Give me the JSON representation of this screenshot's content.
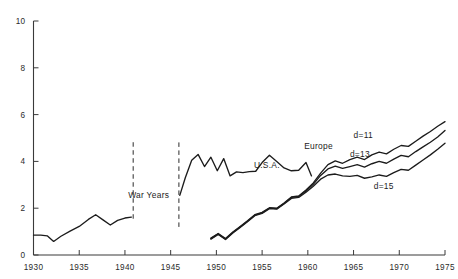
{
  "chart_data": {
    "type": "line",
    "title": "",
    "xlabel": "",
    "ylabel": "",
    "xlim": [
      1930,
      1975
    ],
    "ylim": [
      0,
      10
    ],
    "grid": false,
    "legend_position": "inline-labels",
    "x_ticks": [
      1930,
      1935,
      1940,
      1945,
      1950,
      1955,
      1960,
      1965,
      1970,
      1975
    ],
    "x_tick_labels": [
      "1930",
      "1935",
      "1940",
      "1945",
      "1950",
      "1955",
      "1960",
      "1965",
      "1970",
      "1975"
    ],
    "y_ticks": [
      0,
      2,
      4,
      6,
      8,
      10
    ],
    "y_tick_labels": [
      "0",
      "2",
      "4",
      "6",
      "8",
      "10"
    ],
    "annotations": [
      {
        "text": "War Years",
        "x": 1942.6,
        "y": 2.45,
        "name": "war-years-label"
      }
    ],
    "vertical_dividers": [
      {
        "x": 1940.9,
        "y0": 1.55,
        "y1": 4.9,
        "name": "war-start-divider"
      },
      {
        "x": 1945.9,
        "y0": 1.2,
        "y1": 4.9,
        "name": "war-end-divider"
      }
    ],
    "series": [
      {
        "name": "U.S.A. pre-war",
        "label": "",
        "label_x": 0,
        "label_y": 0,
        "x": [
          1930.0,
          1930.8,
          1931.5,
          1932.2,
          1933.0,
          1934.0,
          1935.0,
          1936.0,
          1936.8,
          1937.6,
          1938.4,
          1939.2,
          1940.0,
          1940.7
        ],
        "y": [
          0.85,
          0.85,
          0.82,
          0.58,
          0.8,
          1.02,
          1.22,
          1.52,
          1.72,
          1.5,
          1.28,
          1.48,
          1.58,
          1.62
        ]
      },
      {
        "name": "U.S.A.",
        "label": "U.S.A.",
        "label_x": 1954.1,
        "label_y": 3.72,
        "x": [
          1946.0,
          1946.6,
          1947.3,
          1948.0,
          1948.7,
          1949.4,
          1950.1,
          1950.8,
          1951.5,
          1952.2,
          1952.9,
          1953.6,
          1954.3,
          1955.0,
          1955.8,
          1956.6,
          1957.4,
          1958.2,
          1959.0,
          1959.8,
          1960.4
        ],
        "y": [
          2.55,
          3.3,
          4.05,
          4.3,
          3.78,
          4.18,
          3.6,
          4.12,
          3.38,
          3.55,
          3.52,
          3.56,
          3.58,
          3.95,
          4.26,
          4.0,
          3.72,
          3.6,
          3.62,
          3.95,
          3.38
        ]
      },
      {
        "name": "Europe d=11",
        "label": "d=11",
        "label_x": 1965.0,
        "label_y": 5.02,
        "x": [
          1949.4,
          1950.2,
          1951.0,
          1951.8,
          1952.6,
          1953.4,
          1954.2,
          1955.0,
          1955.8,
          1956.6,
          1957.4,
          1958.2,
          1959.0,
          1959.8,
          1960.6,
          1961.4,
          1962.2,
          1963.0,
          1963.8,
          1964.6,
          1965.4,
          1966.2,
          1967.0,
          1967.8,
          1968.6,
          1969.4,
          1970.2,
          1971.0,
          1971.8,
          1972.6,
          1973.4,
          1974.2,
          1975.0
        ],
        "y": [
          0.72,
          0.92,
          0.7,
          0.98,
          1.22,
          1.46,
          1.72,
          1.82,
          2.02,
          2.0,
          2.22,
          2.48,
          2.52,
          2.78,
          3.08,
          3.5,
          3.86,
          4.02,
          3.92,
          4.08,
          4.18,
          4.08,
          4.28,
          4.4,
          4.32,
          4.52,
          4.68,
          4.64,
          4.86,
          5.08,
          5.28,
          5.5,
          5.7
        ]
      },
      {
        "name": "Europe d=13",
        "label": "d=13",
        "label_x": 1964.6,
        "label_y": 4.18,
        "x": [
          1949.4,
          1950.2,
          1951.0,
          1951.8,
          1952.6,
          1953.4,
          1954.2,
          1955.0,
          1955.8,
          1956.6,
          1957.4,
          1958.2,
          1959.0,
          1959.8,
          1960.6,
          1961.4,
          1962.2,
          1963.0,
          1963.8,
          1964.6,
          1965.4,
          1966.2,
          1967.0,
          1967.8,
          1968.6,
          1969.4,
          1970.2,
          1971.0,
          1971.8,
          1972.6,
          1973.4,
          1974.2,
          1975.0
        ],
        "y": [
          0.7,
          0.9,
          0.68,
          0.96,
          1.2,
          1.44,
          1.7,
          1.8,
          2.0,
          1.98,
          2.2,
          2.46,
          2.5,
          2.74,
          3.02,
          3.4,
          3.68,
          3.8,
          3.7,
          3.78,
          3.86,
          3.76,
          3.9,
          4.0,
          3.92,
          4.1,
          4.26,
          4.2,
          4.42,
          4.62,
          4.82,
          5.04,
          5.32
        ]
      },
      {
        "name": "Europe d=15",
        "label": "d=15",
        "label_x": 1967.2,
        "label_y": 2.82,
        "x": [
          1949.4,
          1950.2,
          1951.0,
          1951.8,
          1952.6,
          1953.4,
          1954.2,
          1955.0,
          1955.8,
          1956.6,
          1957.4,
          1958.2,
          1959.0,
          1959.8,
          1960.6,
          1961.4,
          1962.2,
          1963.0,
          1963.8,
          1964.6,
          1965.4,
          1966.2,
          1967.0,
          1967.8,
          1968.6,
          1969.4,
          1970.2,
          1971.0,
          1971.8,
          1972.6,
          1973.4,
          1974.2,
          1975.0
        ],
        "y": [
          0.68,
          0.88,
          0.66,
          0.94,
          1.18,
          1.42,
          1.68,
          1.78,
          1.98,
          1.96,
          2.18,
          2.42,
          2.46,
          2.68,
          2.94,
          3.24,
          3.42,
          3.46,
          3.38,
          3.36,
          3.4,
          3.28,
          3.34,
          3.42,
          3.36,
          3.52,
          3.66,
          3.62,
          3.84,
          4.06,
          4.28,
          4.52,
          4.78
        ]
      },
      {
        "name": "Europe top-label-anchor",
        "label": "Europe",
        "label_x": 1959.6,
        "label_y": 4.55,
        "x": [],
        "y": []
      }
    ]
  }
}
